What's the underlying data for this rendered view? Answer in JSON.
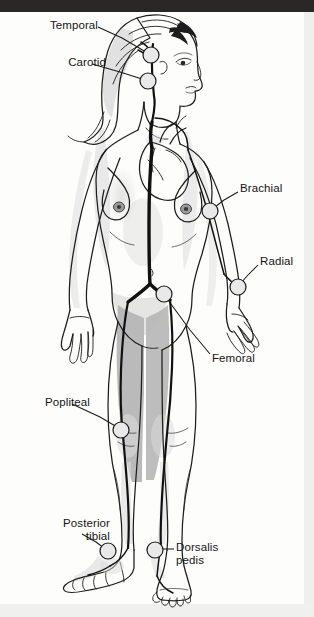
{
  "figure": {
    "background_color": "#fdfdfc",
    "ink_color": "#151515",
    "artery_color": "#111111",
    "shadow_color": "#b9b9b9",
    "top_band_color": "#2a2726",
    "pulse_marker": {
      "shape": "circle",
      "fill": "#e9e9e9",
      "stroke": "#1a1a1a",
      "radius": 8
    }
  },
  "labels": [
    {
      "id": "temporal",
      "text": "Temporal",
      "name": "label-temporal",
      "align": "right",
      "text_x": 26,
      "text_y": 19,
      "leader": [
        [
          98,
          27
        ],
        [
          122,
          38
        ],
        [
          146,
          52
        ]
      ],
      "marker_x": 151,
      "marker_y": 55
    },
    {
      "id": "carotid",
      "text": "Carotid",
      "name": "label-carotid",
      "align": "right",
      "text_x": 34,
      "text_y": 56,
      "leader": [
        [
          92,
          64
        ],
        [
          120,
          72
        ],
        [
          142,
          79
        ]
      ],
      "marker_x": 148,
      "marker_y": 81
    },
    {
      "id": "brachial",
      "text": "Brachial",
      "name": "label-brachial",
      "align": "left",
      "text_x": 240,
      "text_y": 182,
      "leader": [
        [
          238,
          192
        ],
        [
          224,
          200
        ],
        [
          215,
          207
        ]
      ],
      "marker_x": 210,
      "marker_y": 211
    },
    {
      "id": "radial",
      "text": "Radial",
      "name": "label-radial",
      "align": "left",
      "text_x": 260,
      "text_y": 255,
      "leader": [
        [
          258,
          265
        ],
        [
          248,
          275
        ],
        [
          241,
          283
        ]
      ],
      "marker_x": 238,
      "marker_y": 287
    },
    {
      "id": "femoral",
      "text": "Femoral",
      "name": "label-femoral",
      "align": "left",
      "text_x": 212,
      "text_y": 352,
      "leader": [
        [
          210,
          354
        ],
        [
          190,
          330
        ],
        [
          168,
          300
        ]
      ],
      "marker_x": 164,
      "marker_y": 294
    },
    {
      "id": "popliteal",
      "text": "Popliteal",
      "name": "label-popliteal",
      "align": "right",
      "text_x": 18,
      "text_y": 396,
      "leader": [
        [
          72,
          404
        ],
        [
          100,
          417
        ],
        [
          117,
          427
        ]
      ],
      "marker_x": 121,
      "marker_y": 430
    },
    {
      "id": "posterior-tibial",
      "text": "Posterior\ntibial",
      "name": "label-posterior-tibial",
      "align": "right",
      "text_x": 38,
      "text_y": 517,
      "leader": [
        [
          82,
          534
        ],
        [
          96,
          542
        ],
        [
          104,
          548
        ]
      ],
      "marker_x": 108,
      "marker_y": 551
    },
    {
      "id": "dorsalis-pedis",
      "text": "Dorsalis\npedis",
      "name": "label-dorsalis-pedis",
      "align": "left",
      "text_x": 176,
      "text_y": 541,
      "leader": [
        [
          174,
          549
        ],
        [
          166,
          549
        ],
        [
          160,
          549
        ]
      ],
      "marker_x": 155,
      "marker_y": 550
    }
  ],
  "pulse_points": [
    "Temporal",
    "Carotid",
    "Brachial",
    "Radial",
    "Femoral",
    "Popliteal",
    "Posterior tibial",
    "Dorsalis pedis"
  ]
}
